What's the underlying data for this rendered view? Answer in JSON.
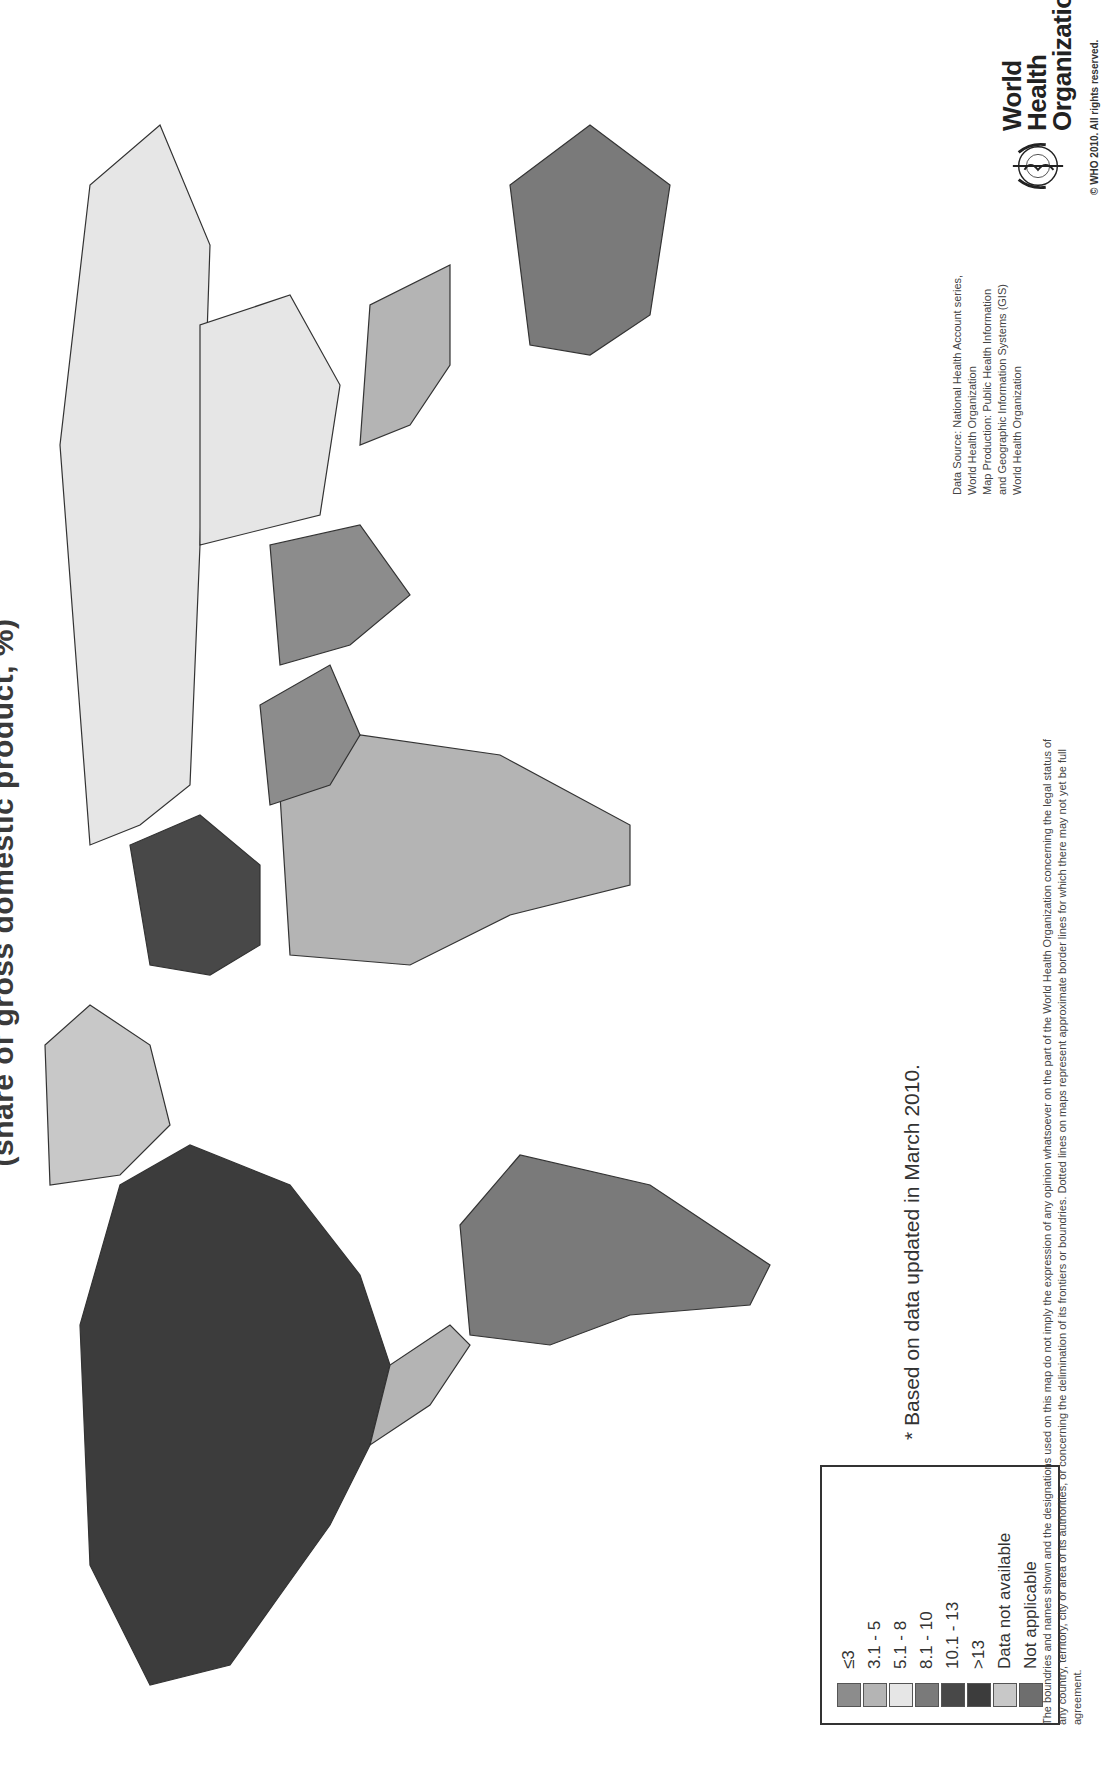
{
  "title": "(share of gross domestic product, %)",
  "title_note": "Only the lower line of the heading is visible; any text above it is cropped out of the frame.",
  "legend": {
    "items": [
      {
        "label": "≤3",
        "color": "#8c8c8c"
      },
      {
        "label": "3.1 - 5",
        "color": "#b4b4b4"
      },
      {
        "label": "5.1 - 8",
        "color": "#e6e6e6"
      },
      {
        "label": "8.1 - 10",
        "color": "#7a7a7a"
      },
      {
        "label": "10.1 - 13",
        "color": "#484848"
      },
      {
        "label": ">13",
        "color": "#3c3c3c"
      },
      {
        "label": "Data not available",
        "color": "#c8c8c8"
      },
      {
        "label": "Not applicable",
        "color": "#6e6e6e"
      }
    ]
  },
  "footnote": "* Based on data updated in March 2010.",
  "disclaimer": "The boundries and names shown and the designations used on this map do not imply the expression of any opinion whatsoever on the part of the World Health Organization concerning the legal status of any country, territory, city or area of its authorities, or concerning the delimination of its frontiers or boundries. Dotted lines on maps represent approximate border lines for which there may not yet be full agreement.",
  "source": {
    "lines": [
      "Data Source: National Health Account series,",
      "World Health Organization",
      "Map Production: Public Health Information",
      "and Geographic Information Systems (GIS)",
      "World Health Organization"
    ]
  },
  "publisher": {
    "name_line1": "World Health",
    "name_line2": "Organization",
    "copyright": "© WHO 2010. All rights reserved."
  },
  "map_data": {
    "type": "choropleth",
    "projection_note": "World map; country geometry not reproduced — placeholder continent shapes only.",
    "region_tones_estimated": [
      {
        "region": "North America (USA/Canada)",
        "legend_class": ">13",
        "confidence": "estimated from shade"
      },
      {
        "region": "Greenland",
        "legend_class": "Data not available",
        "confidence": "estimated from shade"
      },
      {
        "region": "Russia",
        "legend_class": "5.1 - 8",
        "confidence": "estimated from shade"
      },
      {
        "region": "South America (majority)",
        "legend_class": "8.1 - 10",
        "confidence": "estimated from shade"
      },
      {
        "region": "Australia",
        "legend_class": "8.1 - 10",
        "confidence": "estimated from shade"
      },
      {
        "region": "Western Europe",
        "legend_class": "10.1 - 13",
        "confidence": "estimated from shade"
      }
    ],
    "per_country_values": null,
    "per_country_note": "Individual country values cannot be read from the image at this resolution and are intentionally omitted."
  }
}
